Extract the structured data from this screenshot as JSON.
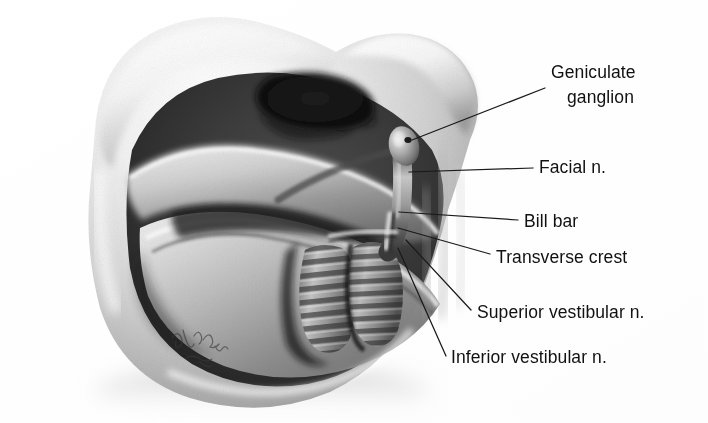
{
  "figure": {
    "caption_absent": true,
    "medium": "graphite / airbrush anatomical illustration, grayscale halftone scan",
    "signature": "artist signature (illegible cursive)",
    "background_color": "#ffffff",
    "ink_color": "#111111",
    "leader_line_color": "#1a1a1a"
  },
  "labels": [
    {
      "id": "geniculate-ganglion",
      "line1": "Geniculate",
      "line2": "ganglion",
      "leader": "from label left edge down-left to the bulbous ganglion tip"
    },
    {
      "id": "facial-nerve",
      "text": "Facial n.",
      "leader": "horizontal line left to the facial nerve trunk"
    },
    {
      "id": "bill-bar",
      "text": "Bill bar",
      "leader": "short line left to the vertical crest (Bill's bar)"
    },
    {
      "id": "transverse-crest",
      "text": "Transverse crest",
      "leader": "line up-left to the transverse crest ridge"
    },
    {
      "id": "superior-vestibular-nerve",
      "text": "Superior vestibular n.",
      "leader": "line up-left to the upper striated nerve lobe"
    },
    {
      "id": "inferior-vestibular-nerve",
      "text": "Inferior vestibular n.",
      "leader": "line up-left to the lower striated nerve lobe"
    }
  ],
  "anatomy": {
    "canal_opening": "dark elliptical internal auditory canal aperture, upper centre",
    "bone_rim": "pale temporal bone rim sweeping across the top and down the left",
    "lower_shelf": "curved inferior bone shelf forming the canal floor",
    "nerve_bundle": "two horizontally striated vestibular nerve lobes in the canal fundus"
  },
  "ghost_text": {
    "note": "faint show-through from the reverse side of the printed page; illegible",
    "lines": [
      "",
      "",
      "",
      "",
      "",
      "",
      ""
    ]
  }
}
